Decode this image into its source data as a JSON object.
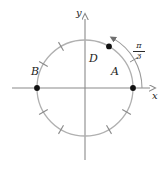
{
  "figure": {
    "kind": "unit-circle-diagram",
    "background_color": "#ffffff",
    "axis_color": "#8a8a8a",
    "circle_color": "#b0b0b0",
    "tick_color": "#8a8a8a",
    "point_color": "#111111",
    "label_color": "#1c1c1c",
    "arc_color": "#9a9a9a"
  },
  "axes": {
    "x_label": "x",
    "y_label": "y",
    "origin": {
      "x": 85,
      "y": 88
    },
    "x_min_px": 12,
    "x_max_px": 156,
    "y_min_px": 160,
    "y_max_px": 14
  },
  "circle": {
    "center_x": 85,
    "center_y": 88,
    "radius": 48
  },
  "points": [
    {
      "id": "A",
      "label": "A",
      "angle_deg": 0,
      "label_dx": 26,
      "label_dy": -22
    },
    {
      "id": "B",
      "label": "B",
      "angle_deg": 180,
      "label_dx": -54,
      "label_dy": -22
    },
    {
      "id": "D",
      "label": "D",
      "angle_deg": 60,
      "label_dx": 4,
      "label_dy": -35
    }
  ],
  "ticks": {
    "angles_deg": [
      120,
      150,
      210,
      240,
      300,
      330
    ],
    "inner_offset": -5,
    "outer_offset": 5
  },
  "arc_annotation": {
    "from_angle_deg": 0,
    "to_angle_deg": 60,
    "radius": 57,
    "arrow_at": "to",
    "label_numerator": "π",
    "label_denominator": "3",
    "label_text": "π/3"
  }
}
